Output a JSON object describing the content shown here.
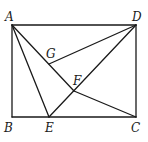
{
  "diagram": {
    "type": "geometry",
    "points": {
      "A": {
        "label": "A",
        "x": 12,
        "y": 25,
        "lx": 5,
        "ly": 21
      },
      "B": {
        "label": "B",
        "x": 12,
        "y": 117,
        "lx": 4,
        "ly": 132
      },
      "C": {
        "label": "C",
        "x": 136,
        "y": 117,
        "lx": 131,
        "ly": 132
      },
      "D": {
        "label": "D",
        "x": 136,
        "y": 25,
        "lx": 132,
        "ly": 21
      },
      "E": {
        "label": "E",
        "x": 49,
        "y": 117,
        "lx": 45,
        "ly": 132
      },
      "F": {
        "label": "F",
        "x": 74,
        "y": 91,
        "lx": 73,
        "ly": 85
      },
      "G": {
        "label": "G",
        "x": 49,
        "y": 64,
        "lx": 46,
        "ly": 58
      }
    },
    "segments": [
      [
        "A",
        "D"
      ],
      [
        "D",
        "C"
      ],
      [
        "C",
        "B"
      ],
      [
        "B",
        "A"
      ],
      [
        "A",
        "E"
      ],
      [
        "A",
        "F"
      ],
      [
        "F",
        "C"
      ],
      [
        "D",
        "G"
      ],
      [
        "D",
        "E"
      ]
    ]
  }
}
